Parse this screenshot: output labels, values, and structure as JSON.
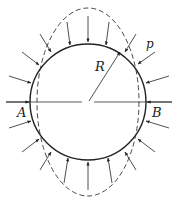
{
  "figure": {
    "labels": {
      "radius": "R",
      "pressure": "p",
      "point_left": "A",
      "point_right": "B"
    },
    "colors": {
      "stroke": "#222222",
      "background": "#ffffff"
    },
    "geometry": {
      "center": [
        88,
        102
      ],
      "circle_radius": 58,
      "deformed_rx": 50,
      "deformed_ry": 94
    }
  }
}
